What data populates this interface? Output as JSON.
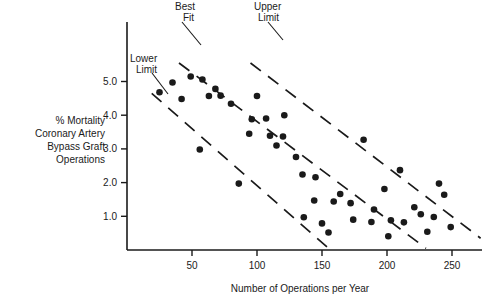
{
  "chart_data": {
    "type": "scatter",
    "title": "",
    "xlabel": "Number of Operations per Year",
    "ylabel_lines": [
      "% Mortality",
      "Coronary Artery",
      "Bypass Graft",
      "Operations"
    ],
    "ylabel": "% Mortality Coronary Artery Bypass Graft Operations",
    "xlim": [
      0,
      272
    ],
    "ylim": [
      0,
      5.7
    ],
    "xticks": [
      50,
      100,
      150,
      200,
      250
    ],
    "xtick_labels": [
      "50",
      "100",
      "150",
      "200",
      "250"
    ],
    "yticks": [
      1.0,
      2.0,
      3.0,
      4.0,
      5.0
    ],
    "ytick_labels": [
      "1.0",
      "2.0",
      "3.0",
      "4.0",
      "5.0"
    ],
    "grid": false,
    "legend_position": "none",
    "marker": "filled-circle",
    "marker_color": "#1a1a1a",
    "annotations": [
      {
        "name": "best-fit",
        "label_lines": [
          "Best",
          "Fit"
        ],
        "label": "Best Fit"
      },
      {
        "name": "upper-limit",
        "label_lines": [
          "Upper",
          "Limit"
        ],
        "label": "Upper Limit"
      },
      {
        "name": "lower-limit",
        "label_lines": [
          "Lower",
          "Limit"
        ],
        "label": "Lower Limit"
      }
    ],
    "reference_lines": [
      {
        "name": "best-fit-line",
        "style": "dashed",
        "x": [
          40,
          230
        ],
        "y": [
          5.55,
          0.05
        ]
      },
      {
        "name": "upper-limit-line",
        "style": "dashed",
        "x": [
          95,
          272
        ],
        "y": [
          5.55,
          0.35
        ]
      },
      {
        "name": "lower-limit-line",
        "style": "dashed",
        "x": [
          19,
          156
        ],
        "y": [
          4.65,
          0.02
        ]
      }
    ],
    "points": [
      {
        "x": 25,
        "y": 4.68
      },
      {
        "x": 35,
        "y": 4.97
      },
      {
        "x": 42,
        "y": 4.48
      },
      {
        "x": 49,
        "y": 5.15
      },
      {
        "x": 56,
        "y": 2.98
      },
      {
        "x": 58,
        "y": 5.06
      },
      {
        "x": 63,
        "y": 4.57
      },
      {
        "x": 68,
        "y": 4.78
      },
      {
        "x": 72,
        "y": 4.58
      },
      {
        "x": 80,
        "y": 4.34
      },
      {
        "x": 86,
        "y": 1.97
      },
      {
        "x": 94,
        "y": 3.45
      },
      {
        "x": 96,
        "y": 3.88
      },
      {
        "x": 100,
        "y": 4.57
      },
      {
        "x": 107,
        "y": 3.9
      },
      {
        "x": 110,
        "y": 3.39
      },
      {
        "x": 115,
        "y": 3.1
      },
      {
        "x": 120,
        "y": 3.37
      },
      {
        "x": 121,
        "y": 4.0
      },
      {
        "x": 130,
        "y": 2.76
      },
      {
        "x": 135,
        "y": 2.24
      },
      {
        "x": 136,
        "y": 0.97
      },
      {
        "x": 144,
        "y": 1.47
      },
      {
        "x": 145,
        "y": 2.16
      },
      {
        "x": 150,
        "y": 0.79
      },
      {
        "x": 155,
        "y": 0.52
      },
      {
        "x": 159,
        "y": 1.44
      },
      {
        "x": 164,
        "y": 1.66
      },
      {
        "x": 172,
        "y": 1.39
      },
      {
        "x": 174,
        "y": 0.9
      },
      {
        "x": 182,
        "y": 3.27
      },
      {
        "x": 188,
        "y": 0.83
      },
      {
        "x": 190,
        "y": 1.2
      },
      {
        "x": 198,
        "y": 1.81
      },
      {
        "x": 201,
        "y": 0.41
      },
      {
        "x": 203,
        "y": 0.88
      },
      {
        "x": 210,
        "y": 2.37
      },
      {
        "x": 213,
        "y": 0.82
      },
      {
        "x": 221,
        "y": 1.27
      },
      {
        "x": 226,
        "y": 1.06
      },
      {
        "x": 231,
        "y": 0.54
      },
      {
        "x": 236,
        "y": 0.98
      },
      {
        "x": 240,
        "y": 1.97
      },
      {
        "x": 244,
        "y": 1.64
      },
      {
        "x": 249,
        "y": 0.68
      }
    ]
  }
}
